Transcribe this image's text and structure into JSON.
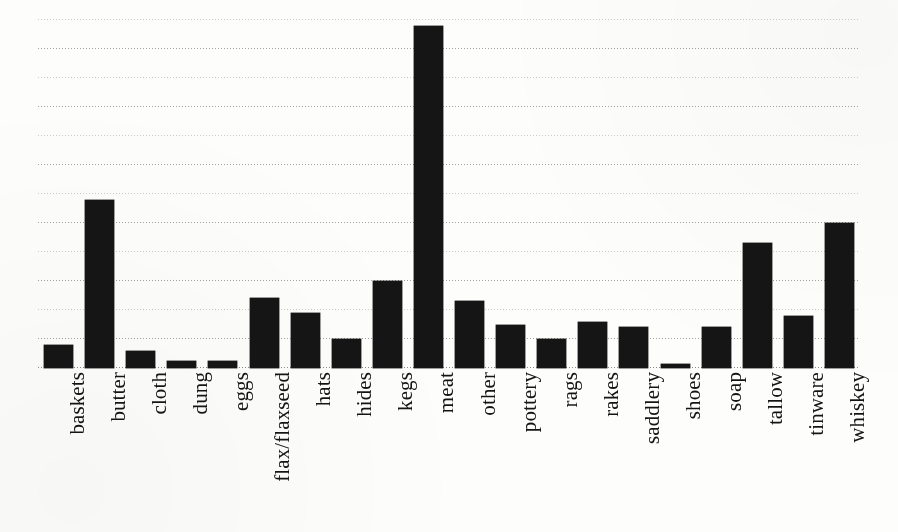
{
  "chart_data": {
    "type": "bar",
    "title": "",
    "subtitle": "",
    "xlabel": "",
    "ylabel": "",
    "categories": [
      "baskets",
      "butter",
      "cloth",
      "dung",
      "eggs",
      "flax/flaxseed",
      "hats",
      "hides",
      "kegs",
      "meat",
      "other",
      "pottery",
      "rags",
      "rakes",
      "saddlery",
      "shoes",
      "soap",
      "tallow",
      "tinware",
      "whiskey"
    ],
    "values": [
      0.8,
      5.8,
      0.6,
      0.25,
      0.25,
      2.4,
      1.9,
      1.0,
      3.0,
      11.8,
      2.3,
      1.5,
      1.0,
      1.6,
      1.4,
      0.15,
      1.4,
      4.3,
      1.8,
      5.0
    ],
    "ylim": [
      0,
      12.0
    ],
    "yticks": [
      0,
      1,
      2,
      3,
      4,
      5,
      6,
      7,
      8,
      9,
      10,
      11,
      12
    ],
    "ytick_labels": [],
    "grid": true,
    "grid_orientation": "horizontal",
    "grid_style": "dotted",
    "legend": false,
    "legend_position": "none",
    "bar_color": "#151515",
    "background_color": "#ffffff",
    "axis_label_rotation": -90,
    "n_categories": 20,
    "max_value_category": "meat",
    "min_value_category": "shoes"
  },
  "figure": {
    "name": "bar-chart"
  }
}
